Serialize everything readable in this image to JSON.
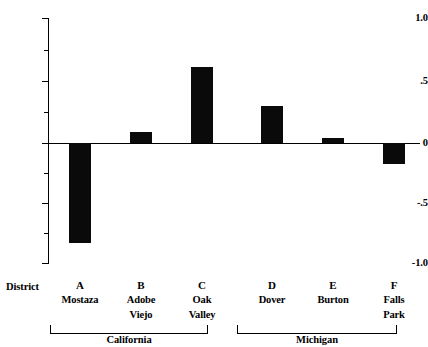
{
  "chart_data": {
    "type": "bar",
    "title": "",
    "xlabel": "District",
    "ylabel": "",
    "categories": [
      "A",
      "B",
      "C",
      "D",
      "E",
      "F"
    ],
    "category_names": [
      "Mostaza",
      "Adobe Viejo",
      "Oak Valley",
      "Dover",
      "Burton",
      "Falls Park"
    ],
    "values": [
      -0.8,
      0.09,
      0.61,
      0.3,
      0.04,
      -0.17
    ],
    "ylim": [
      -1.0,
      1.0
    ],
    "yticks": [
      1.0,
      0.5,
      0.0,
      -0.5,
      -1.0
    ],
    "ytick_labels": [
      "1.0",
      ".5",
      "0",
      "-.5",
      "-1.0"
    ],
    "grid": false,
    "legend": "none",
    "bar_color": "#0a0a0a",
    "groups": [
      {
        "label": "California",
        "categories": [
          "A",
          "B",
          "C"
        ]
      },
      {
        "label": "Michigan",
        "categories": [
          "D",
          "E",
          "F"
        ]
      }
    ]
  },
  "axis": {
    "y_tick_labels": [
      "1.0",
      ".5",
      "0",
      "-.5",
      "-1.0"
    ],
    "x_axis_caption": "District"
  },
  "x_items": [
    {
      "code": "A",
      "name_line1": "Mostaza",
      "name_line2": ""
    },
    {
      "code": "B",
      "name_line1": "Adobe",
      "name_line2": "Viejo"
    },
    {
      "code": "C",
      "name_line1": "Oak",
      "name_line2": "Valley"
    },
    {
      "code": "D",
      "name_line1": "Dover",
      "name_line2": ""
    },
    {
      "code": "E",
      "name_line1": "Burton",
      "name_line2": ""
    },
    {
      "code": "F",
      "name_line1": "Falls",
      "name_line2": "Park"
    }
  ],
  "groups": [
    {
      "label": "California"
    },
    {
      "label": "Michigan"
    }
  ]
}
